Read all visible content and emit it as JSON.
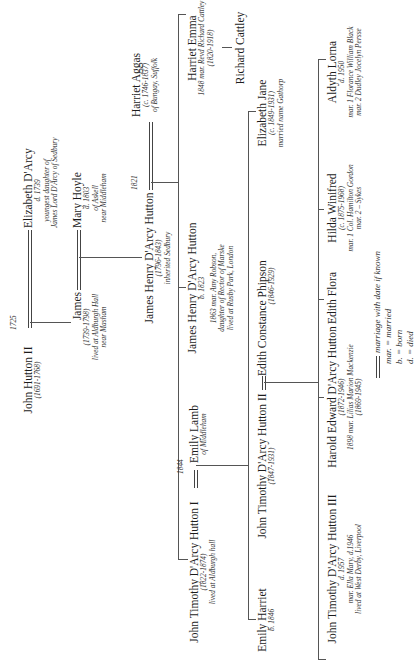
{
  "diagram": {
    "orientation": "rotated -90deg (reads bottom-to-top)",
    "generations": [
      {
        "couple": {
          "husband": {
            "name": "John Hutton II",
            "dates": "(1691-1768)"
          },
          "marriage_year": "1725",
          "wife": {
            "name": "Elizabeth D'Arcy",
            "dates": "d. 1739",
            "note1": "youngest daughter of",
            "note2": "James Lord D'Arcy of Sedbury"
          }
        }
      },
      {
        "couple": {
          "husband": {
            "name": "James",
            "dates": "(1739-1798)",
            "note1": "lived at Aldburgh Hall",
            "note2": "near Masham"
          },
          "wife": {
            "name": "Mary Hoyle",
            "dates": "d. 1803",
            "note1": "of Askell",
            "note2": "near Middleham"
          }
        }
      },
      {
        "couple": {
          "husband": {
            "name": "James Henry D'Arcy Hutton",
            "dates": "(1796-1843)",
            "note1": "inherited Sedbury"
          },
          "marriage_year": "1821",
          "wife": {
            "name": "Harriet Aggas",
            "dates": "(c. 1746-1837)",
            "note1": "of Bungay, Suffolk"
          }
        }
      }
    ],
    "children_of_1821": [
      {
        "name": "John Timothy D'Arcy Hutton I",
        "dates": "(1822-1874)",
        "note1": "lived at Aldburgh hall"
      },
      {
        "name": "James Henry D'Arcy Hutton",
        "dates": "b. 1823",
        "note1": "1863 mar. Amy Robson,",
        "note2": "daughter of Rector of Marske",
        "note3": "lived at Rusby Park, London"
      },
      {
        "name": "Harriet Emma",
        "dates": "1848 mar. Revd Richard Cattley",
        "note1": "(1820-1918)"
      }
    ],
    "richard_cattley": {
      "name": "Richard Cattley"
    },
    "jt1_spouse": {
      "name": "Emily Lamb",
      "note1": "of Middleham",
      "marriage_year": "1844"
    },
    "children_of_1844": [
      {
        "name": "Emily Harriet",
        "dates": "b. 1846"
      },
      {
        "name": "John Timothy D'Arcy Hutton II",
        "dates": "(1847-1931)"
      },
      {
        "name": "Elizabeth Jane",
        "dates": "(c. 1849-1931)",
        "note1": "married name Gathorp"
      }
    ],
    "jt2_spouse": {
      "name": "Edith Constance Phipson",
      "dates": "(1846-1929)"
    },
    "children_of_jt2": [
      {
        "name": "John Timothy D'Arcy Hutton III",
        "dates": "d. 1957",
        "note1": "mar. Ella Mary, d.1946",
        "note2": "lived at West Derby, Liverpool"
      },
      {
        "name": "Harold Edward D'Arcy Hutton",
        "dates": "(1872-1946)",
        "note1": "1898 mar. Lilias Marion Mackenzie",
        "note2": "(1869-1945)"
      },
      {
        "name": "Edith Flora"
      },
      {
        "name": "Hilda Winifred",
        "dates": "(c. 1875-1968)",
        "note1": "mar. 1 Col. Hamilton Gordon",
        "note2": "mar. 2 – Sykes"
      },
      {
        "name": "Aldyth Lorna",
        "dates": "d. 1950",
        "note1": "mar. 1 Florance William Black",
        "note2": "mar. 2 Dudley Jocelyn Persse"
      }
    ],
    "legend": {
      "marriage": "marriage with date if known",
      "mar": "mar. = married",
      "b": "b. = born",
      "d": "d. = died"
    }
  }
}
